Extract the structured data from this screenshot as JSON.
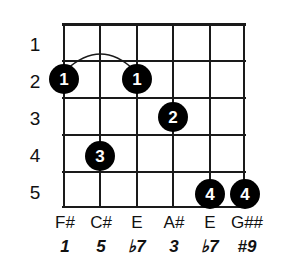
{
  "diagram": {
    "type": "guitar-chord-diagram",
    "strings": 6,
    "frets": 5,
    "dot_color": "#000000",
    "grid_color": "#1a1a1a",
    "text_color": "#111111",
    "background_color": "#ffffff"
  },
  "fret_numbers": [
    "1",
    "2",
    "3",
    "4",
    "5"
  ],
  "strings": [
    {
      "index": 1,
      "note": "F#",
      "interval": "1"
    },
    {
      "index": 2,
      "note": "C#",
      "interval": "5"
    },
    {
      "index": 3,
      "note": "E",
      "interval": "♭7"
    },
    {
      "index": 4,
      "note": "A#",
      "interval": "3"
    },
    {
      "index": 5,
      "note": "E",
      "interval": "♭7"
    },
    {
      "index": 6,
      "note": "G##",
      "interval": "#9"
    }
  ],
  "dots": [
    {
      "id": "dot-s1-f2",
      "finger": "1",
      "string": 1,
      "fret": 2
    },
    {
      "id": "dot-s3-f2",
      "finger": "1",
      "string": 3,
      "fret": 2
    },
    {
      "id": "dot-s4-f3",
      "finger": "2",
      "string": 4,
      "fret": 3
    },
    {
      "id": "dot-s2-f4",
      "finger": "3",
      "string": 2,
      "fret": 4
    },
    {
      "id": "dot-s5-f5",
      "finger": "4",
      "string": 5,
      "fret": 5
    },
    {
      "id": "dot-s6-f5",
      "finger": "4",
      "string": 6,
      "fret": 5
    }
  ],
  "barre": {
    "finger": "1",
    "fret": 2,
    "from_string": 1,
    "to_string": 3
  }
}
